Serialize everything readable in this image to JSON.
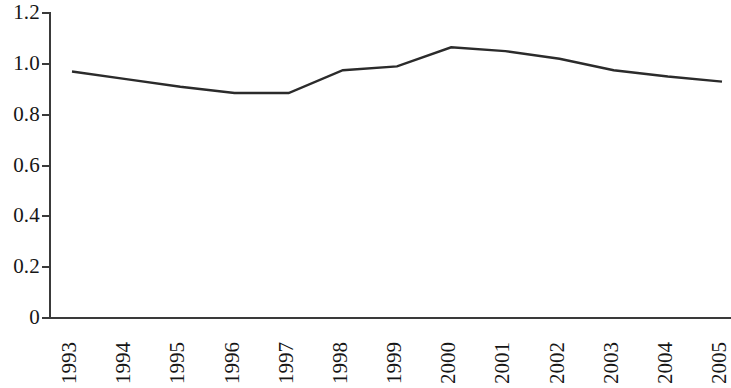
{
  "chart_data": {
    "type": "line",
    "title": "",
    "subtitle": "",
    "xlabel": "",
    "ylabel": "",
    "categories": [
      "1993",
      "1994",
      "1995",
      "1996",
      "1997",
      "1998",
      "1999",
      "2000",
      "2001",
      "2002",
      "2003",
      "2004",
      "2005"
    ],
    "series": [
      {
        "name": "",
        "color": "#2b2b2b",
        "values": [
          0.97,
          0.94,
          0.91,
          0.885,
          0.885,
          0.975,
          0.99,
          1.065,
          1.05,
          1.02,
          0.975,
          0.95,
          0.93
        ]
      }
    ],
    "ylim": [
      0,
      1.2
    ],
    "ytick_labels": [
      "1.2",
      "1.0",
      "0.8",
      "0.6",
      "0.4",
      "0.2",
      "0"
    ],
    "ytick_values": [
      1.2,
      1.0,
      0.8,
      0.6,
      0.4,
      0.2,
      0
    ],
    "grid": false,
    "legend": "none",
    "axis_color": "#3a3a3a",
    "background_color": "#ffffff",
    "xtick_rotation": -90
  }
}
